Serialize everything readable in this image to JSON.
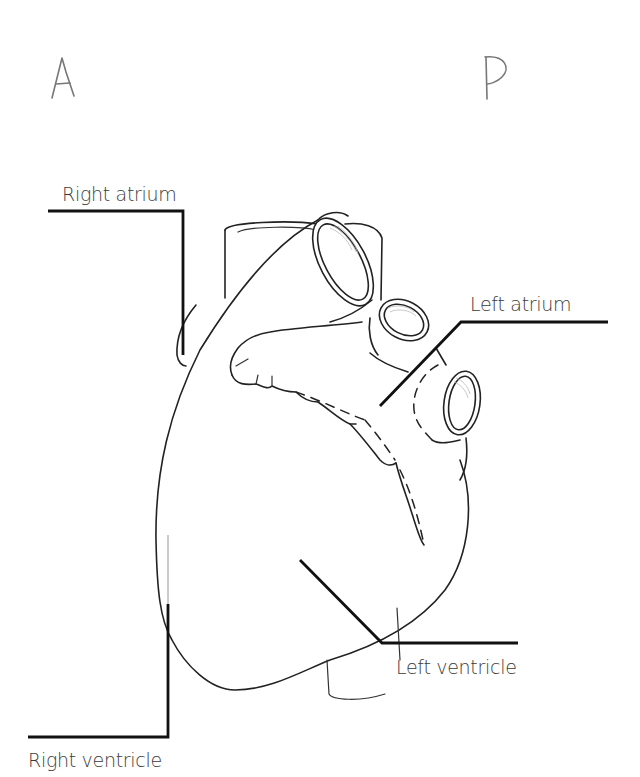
{
  "diagram": {
    "orientation": {
      "anterior_marker": "A",
      "posterior_marker": "P"
    },
    "labels": {
      "right_atrium": "Right atrium",
      "left_atrium": "Left atrium",
      "left_ventricle": "Left ventricle",
      "right_ventricle": "Right ventricle"
    },
    "colors": {
      "line": "#222222",
      "label_text": "#3a3a3a",
      "marker": "#777777",
      "background": "#ffffff"
    }
  }
}
